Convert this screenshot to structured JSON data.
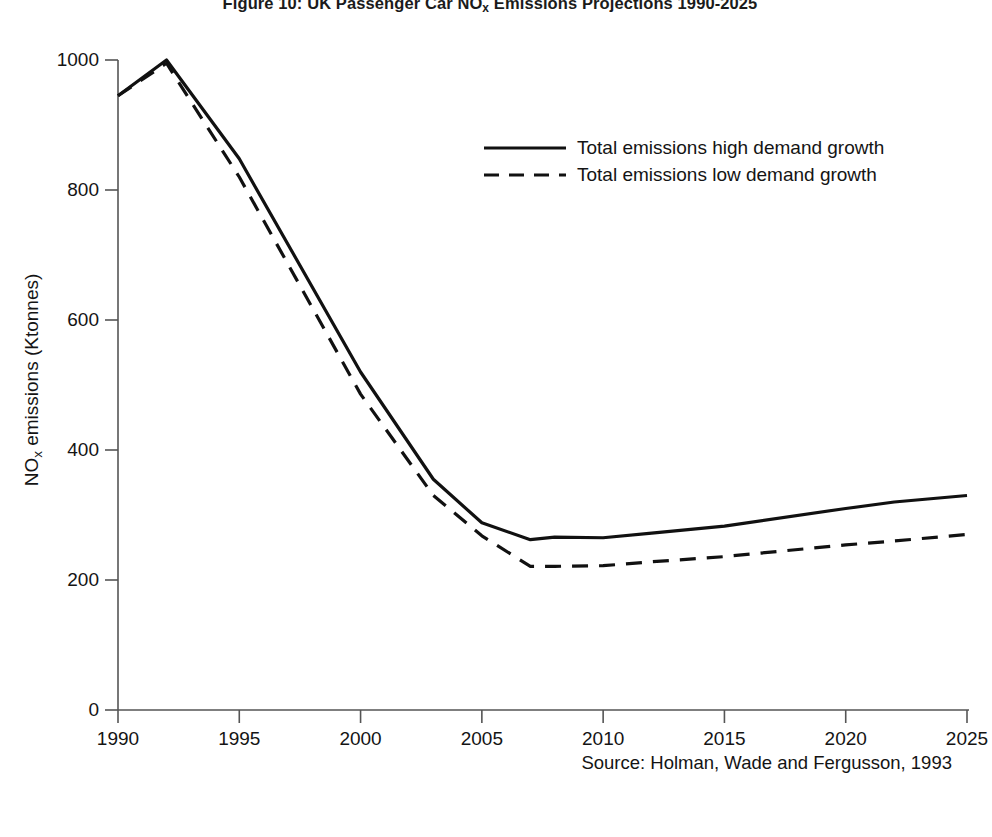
{
  "figure": {
    "title_prefix": "Figure 10: UK Passenger Car NO",
    "title_sub": "x",
    "title_suffix": " Emissions Projections 1990-2025",
    "title_full": "Figure 10: UK Passenger Car NOx Emissions Projections 1990-2025",
    "source_note": "Source: Holman, Wade and Fergusson, 1993",
    "line_color": "#111111",
    "background_color": "#ffffff",
    "axis_color": "#444444"
  },
  "axes": {
    "y_title_prefix": "NO",
    "y_title_sub": "x",
    "y_title_suffix": " emissions (Ktonnes)",
    "y_ticks": [
      "0",
      "200",
      "400",
      "600",
      "800",
      "1000"
    ],
    "x_ticks": [
      "1990",
      "1995",
      "2000",
      "2005",
      "2010",
      "2015",
      "2020",
      "2025"
    ]
  },
  "legend": {
    "position": "inside-upper-right",
    "entries": [
      {
        "label": "Total emissions high demand growth",
        "style": "solid"
      },
      {
        "label": "Total emissions low demand growth",
        "style": "dashed"
      }
    ]
  },
  "chart_data": {
    "type": "line",
    "title": "Figure 10: UK Passenger Car NOx Emissions Projections 1990-2025",
    "xlabel": "",
    "ylabel": "NOx emissions (Ktonnes)",
    "xlim": [
      1990,
      2025
    ],
    "ylim": [
      0,
      1000
    ],
    "grid": false,
    "legend_position": "inside-upper-right",
    "source": "Source: Holman, Wade and Fergusson, 1993",
    "x": [
      1990,
      1992,
      1995,
      2000,
      2003,
      2005,
      2007,
      2008,
      2010,
      2012,
      2015,
      2020,
      2022,
      2025
    ],
    "series": [
      {
        "name": "Total emissions high demand growth",
        "style": "solid",
        "values": [
          945,
          1000,
          848,
          520,
          355,
          288,
          262,
          266,
          265,
          272,
          283,
          310,
          320,
          330
        ]
      },
      {
        "name": "Total emissions low demand growth",
        "style": "dashed",
        "values": [
          945,
          995,
          820,
          486,
          330,
          268,
          221,
          221,
          222,
          228,
          236,
          254,
          260,
          270
        ]
      }
    ]
  }
}
